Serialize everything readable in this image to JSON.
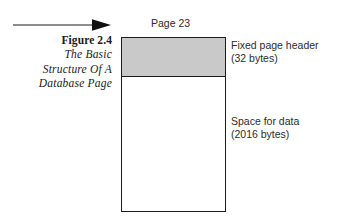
{
  "figure": {
    "number_label": "Figure 2.4",
    "title_lines": [
      "The Basic",
      "Structure Of A",
      "Database Page"
    ]
  },
  "diagram": {
    "page_title": "Page 23",
    "pointer_icon": "right-arrow-icon",
    "colors": {
      "header_fill": "#c9c9c9",
      "body_fill": "#ffffff",
      "stroke": "#1c1c1c",
      "text": "#2b2b2b"
    },
    "segments": [
      {
        "id": "fixed-page-header",
        "label": "Fixed page header",
        "size_label": "(32 bytes)",
        "bytes": 32
      },
      {
        "id": "space-for-data",
        "label": "Space for data",
        "size_label": "(2016 bytes)",
        "bytes": 2016
      }
    ]
  }
}
